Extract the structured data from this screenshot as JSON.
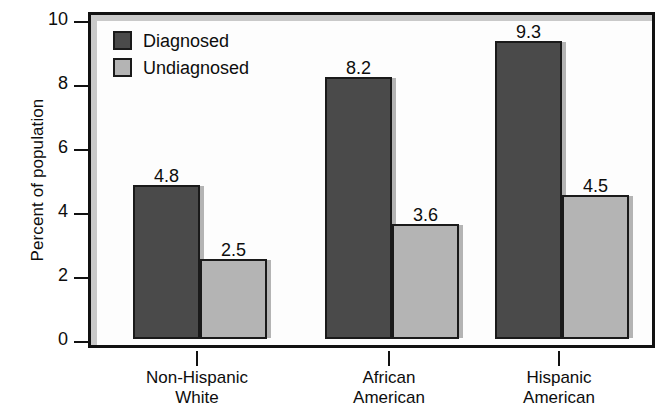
{
  "chart_data": {
    "type": "bar",
    "title": "",
    "xlabel": "",
    "ylabel": "Percent of population",
    "ylim": [
      0,
      10
    ],
    "yticks": [
      "0",
      "2",
      "4",
      "6",
      "8",
      "10"
    ],
    "grid": false,
    "legend_position": "top-left inside plot",
    "categories": [
      {
        "line1": "Non-Hispanic",
        "line2": "White"
      },
      {
        "line1": "African",
        "line2": "American"
      },
      {
        "line1": "Hispanic",
        "line2": "American"
      }
    ],
    "series": [
      {
        "name": "Diagnosed",
        "color": "#4a4a4a",
        "values": [
          4.8,
          8.2,
          9.3
        ],
        "labels": [
          "4.8",
          "8.2",
          "9.3"
        ]
      },
      {
        "name": "Undiagnosed",
        "color": "#b4b4b4",
        "values": [
          2.5,
          3.6,
          4.5
        ],
        "labels": [
          "2.5",
          "3.6",
          "4.5"
        ]
      }
    ]
  },
  "legend": {
    "items": [
      {
        "label": "Diagnosed",
        "swatch": "dark"
      },
      {
        "label": "Undiagnosed",
        "swatch": "light"
      }
    ]
  }
}
